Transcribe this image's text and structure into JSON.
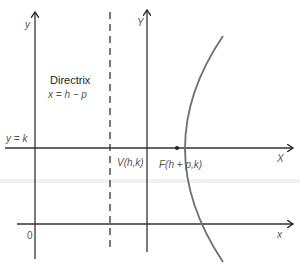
{
  "diagram": {
    "type": "parabola-translated-axes",
    "labels": {
      "y_left": "y",
      "Y_right": "Y",
      "X_upper": "X",
      "x_lower": "x",
      "origin": "0",
      "y_eq_k": "y = k",
      "directrix_title": "Directrix",
      "directrix_eq": "x = h − p",
      "vertex": "V(h,k)",
      "focus": "F(h + p,k)"
    },
    "colors": {
      "axis": "#333333",
      "curve": "#707070",
      "text": "#555555"
    }
  }
}
